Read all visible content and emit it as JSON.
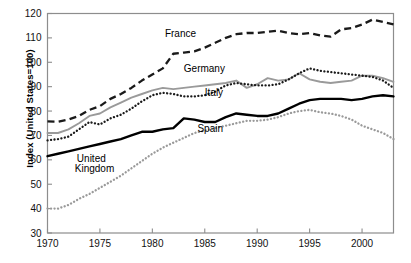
{
  "chart_data": {
    "type": "line",
    "title": "",
    "subtitle": "",
    "xlabel": "",
    "ylabel": "Index  (United States=100)",
    "xlim": [
      1970,
      2003
    ],
    "ylim": [
      30,
      120
    ],
    "grid": false,
    "legend_position": "inline-annotations",
    "x_ticks": [
      "1970",
      "1975",
      "1980",
      "1985",
      "1990",
      "1995",
      "2000"
    ],
    "x_tick_values": [
      1970,
      1975,
      1980,
      1985,
      1990,
      1995,
      2000
    ],
    "y_ticks": [
      "30",
      "40",
      "50",
      "60",
      "70",
      "80",
      "90",
      "100",
      "110",
      "120"
    ],
    "y_tick_values": [
      30,
      40,
      50,
      60,
      70,
      80,
      90,
      100,
      110,
      120
    ],
    "x": [
      1970,
      1971,
      1972,
      1973,
      1974,
      1975,
      1976,
      1977,
      1978,
      1979,
      1980,
      1981,
      1982,
      1983,
      1984,
      1985,
      1986,
      1987,
      1988,
      1989,
      1990,
      1991,
      1992,
      1993,
      1994,
      1995,
      1996,
      1997,
      1998,
      1999,
      2000,
      2001,
      2002,
      2003
    ],
    "series": [
      {
        "name": "France",
        "color": "#1a1a1a",
        "style": "dashed",
        "values": [
          75.8,
          75.6,
          76.5,
          78.0,
          80.5,
          82.0,
          85.0,
          87.0,
          89.5,
          92.5,
          95.0,
          97.5,
          103.5,
          104.0,
          104.5,
          106.0,
          108.0,
          110.0,
          111.5,
          112.0,
          112.0,
          112.5,
          113.0,
          112.0,
          111.5,
          112.0,
          111.0,
          110.5,
          113.5,
          114.0,
          115.5,
          117.5,
          116.5,
          115.5
        ]
      },
      {
        "name": "Germany",
        "color": "#9a9a9a",
        "style": "solid",
        "values": [
          71.0,
          71.0,
          72.5,
          75.0,
          78.0,
          79.0,
          81.5,
          83.5,
          85.5,
          87.0,
          88.5,
          89.5,
          89.0,
          89.5,
          90.0,
          90.5,
          91.0,
          91.5,
          92.5,
          89.5,
          91.0,
          93.5,
          92.5,
          93.0,
          95.5,
          93.0,
          92.0,
          91.5,
          92.0,
          92.5,
          94.5,
          94.5,
          93.5,
          92.0
        ]
      },
      {
        "name": "Italy",
        "color": "#1a1a1a",
        "style": "dotted",
        "values": [
          68.0,
          68.5,
          69.5,
          72.5,
          75.5,
          74.5,
          77.0,
          78.5,
          81.0,
          84.0,
          86.5,
          87.5,
          87.0,
          86.0,
          86.0,
          86.5,
          88.0,
          90.5,
          91.5,
          91.0,
          90.5,
          90.5,
          91.0,
          93.0,
          95.5,
          97.5,
          96.5,
          96.0,
          95.5,
          95.0,
          94.5,
          94.0,
          92.5,
          89.5
        ]
      },
      {
        "name": "United Kingdom",
        "color": "#000000",
        "style": "solid-thick",
        "values": [
          61.5,
          62.5,
          63.5,
          64.5,
          65.5,
          66.5,
          67.5,
          68.5,
          70.0,
          71.5,
          71.5,
          72.5,
          73.0,
          77.0,
          76.5,
          75.5,
          75.5,
          77.5,
          79.0,
          78.5,
          78.0,
          78.0,
          79.0,
          81.0,
          83.0,
          84.5,
          85.0,
          85.0,
          85.0,
          84.5,
          85.0,
          86.0,
          86.5,
          86.0
        ]
      },
      {
        "name": "Spain",
        "color": "#9a9a9a",
        "style": "dotted",
        "values": [
          40.0,
          40.0,
          41.5,
          44.0,
          46.0,
          48.5,
          51.0,
          53.5,
          56.5,
          59.5,
          62.5,
          65.0,
          67.0,
          69.0,
          71.0,
          72.0,
          73.0,
          74.0,
          75.0,
          76.0,
          76.0,
          76.5,
          77.5,
          79.0,
          80.0,
          80.5,
          79.5,
          79.0,
          78.0,
          76.5,
          74.0,
          72.5,
          71.0,
          68.5
        ]
      }
    ],
    "annotations": [
      {
        "text": "France",
        "x": 1981.2,
        "y": 110.5
      },
      {
        "text": "Germany",
        "x": 1983.0,
        "y": 96.0
      },
      {
        "text": "Italy",
        "x": 1985.0,
        "y": 86.0
      },
      {
        "text": "United",
        "x": 1972.8,
        "y": 59.0
      },
      {
        "text": "Kingdom",
        "x": 1972.6,
        "y": 55.0
      },
      {
        "text": "Spain",
        "x": 1984.3,
        "y": 71.5
      }
    ]
  }
}
